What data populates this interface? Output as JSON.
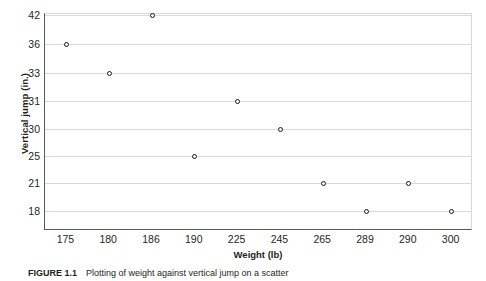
{
  "figure": {
    "caption_label": "FIGURE 1.1",
    "caption_text": "Plotting of weight against vertical jump on a scatter"
  },
  "chart_data": {
    "type": "scatter",
    "title": "",
    "xlabel": "Weight (lb)",
    "ylabel": "Vertical jump (in.)",
    "categories": [
      "175",
      "180",
      "186",
      "190",
      "225",
      "245",
      "265",
      "289",
      "290",
      "300"
    ],
    "y_tick_labels": [
      "42",
      "36",
      "33",
      "31",
      "30",
      "25",
      "21",
      "18"
    ],
    "grid": true,
    "legend": "none",
    "points": [
      {
        "x": "175",
        "y": "36"
      },
      {
        "x": "180",
        "y": "33"
      },
      {
        "x": "186",
        "y": "42"
      },
      {
        "x": "190",
        "y": "25"
      },
      {
        "x": "225",
        "y": "31"
      },
      {
        "x": "245",
        "y": "30"
      },
      {
        "x": "265",
        "y": "21"
      },
      {
        "x": "289",
        "y": "18"
      },
      {
        "x": "290",
        "y": "21"
      },
      {
        "x": "300",
        "y": "18"
      }
    ],
    "marker": "open-circle",
    "marker_color": "#1a1a1a",
    "gridline_color": "#d9d9da",
    "axis_color": "#58595b"
  }
}
